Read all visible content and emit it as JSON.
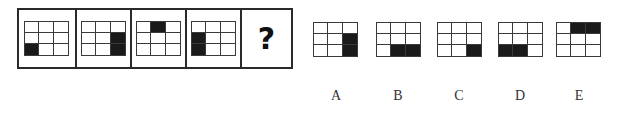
{
  "puzzle": {
    "question_mark": "?",
    "sequence": [
      {
        "id": "frame-1",
        "filled": [
          [
            2,
            0
          ]
        ]
      },
      {
        "id": "frame-2",
        "filled": [
          [
            1,
            2
          ],
          [
            2,
            2
          ]
        ]
      },
      {
        "id": "frame-3",
        "filled": [
          [
            0,
            1
          ]
        ]
      },
      {
        "id": "frame-4",
        "filled": [
          [
            1,
            0
          ],
          [
            2,
            0
          ]
        ]
      }
    ],
    "options": [
      {
        "label": "A",
        "filled": [
          [
            1,
            2
          ],
          [
            2,
            2
          ]
        ]
      },
      {
        "label": "B",
        "filled": [
          [
            2,
            1
          ],
          [
            2,
            2
          ]
        ]
      },
      {
        "label": "C",
        "filled": [
          [
            2,
            2
          ]
        ]
      },
      {
        "label": "D",
        "filled": [
          [
            2,
            0
          ],
          [
            2,
            1
          ]
        ]
      },
      {
        "label": "E",
        "filled": [
          [
            0,
            1
          ],
          [
            0,
            2
          ]
        ]
      }
    ],
    "grid_size": {
      "rows": 3,
      "cols": 3
    },
    "colors": {
      "filled": "#1a1a1a",
      "line": "#3a3a3a",
      "frame": "#2a2a2a"
    }
  }
}
